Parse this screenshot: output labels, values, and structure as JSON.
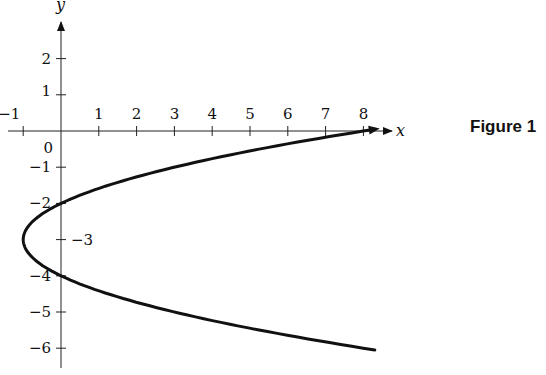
{
  "figure": {
    "caption": "Figure 1"
  },
  "chart_data": {
    "type": "line",
    "title": "",
    "caption": "Figure 1",
    "xlabel": "x",
    "ylabel": "y",
    "equation_implied": "x = (y + 3)^2 - 1",
    "x_ticks": [
      -1,
      1,
      2,
      3,
      4,
      5,
      6,
      7,
      8
    ],
    "y_ticks": [
      2,
      1,
      0,
      -1,
      -2,
      -3,
      -4,
      -5,
      -6
    ],
    "xlim": [
      -1.5,
      8.8
    ],
    "ylim": [
      -6.3,
      3
    ],
    "grid": false,
    "legend": null,
    "series": [
      {
        "name": "parabola",
        "points": [
          {
            "x": 8.3,
            "y": 0.05
          },
          {
            "x": 8,
            "y": 0
          },
          {
            "x": 5.25,
            "y": -0.5
          },
          {
            "x": 3,
            "y": -1
          },
          {
            "x": 1.25,
            "y": -1.5
          },
          {
            "x": 0,
            "y": -2
          },
          {
            "x": -0.75,
            "y": -2.5
          },
          {
            "x": -1,
            "y": -3
          },
          {
            "x": -0.75,
            "y": -3.5
          },
          {
            "x": 0,
            "y": -4
          },
          {
            "x": 1.25,
            "y": -4.5
          },
          {
            "x": 3,
            "y": -5
          },
          {
            "x": 5.25,
            "y": -5.5
          },
          {
            "x": 8,
            "y": -6
          },
          {
            "x": 8.3,
            "y": -6.05
          }
        ],
        "vertex": {
          "x": -1,
          "y": -3
        },
        "y_intercepts": [
          -2,
          -4
        ],
        "top_end_arrow": true
      }
    ],
    "labels": {
      "x_tick_labels": [
        "−1",
        "1",
        "2",
        "3",
        "4",
        "5",
        "6",
        "7",
        "8"
      ],
      "y_tick_labels": [
        "2",
        "1",
        "0",
        "−1",
        "−2",
        "−3",
        "−4",
        "−5",
        "−6"
      ]
    }
  }
}
